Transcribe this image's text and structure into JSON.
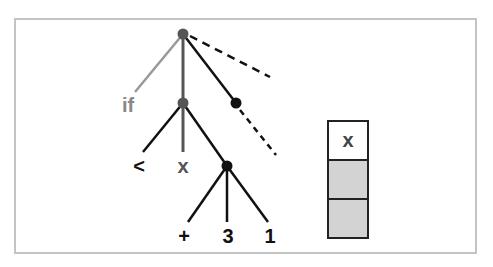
{
  "diagram": {
    "type": "tree",
    "colors": {
      "frame": "#c4c4c4",
      "edge": "#111111",
      "edge_gray": "#999999",
      "node_gray": "#555555",
      "node_black": "#111111",
      "label_black": "#111111",
      "label_gray": "#888888",
      "stack_fill": "#d3d3d3"
    },
    "nodes": [
      {
        "id": "root",
        "label": "",
        "style": "gray"
      },
      {
        "id": "cond",
        "label": "",
        "style": "gray"
      },
      {
        "id": "expr",
        "label": "",
        "style": "black"
      },
      {
        "id": "plus_node",
        "label": "",
        "style": "black"
      }
    ],
    "leaves": {
      "if": "if",
      "lt": "<",
      "x": "x",
      "plus": "+",
      "three": "3",
      "one": "1"
    },
    "stack": {
      "cells": [
        {
          "label": "x",
          "filled": false
        },
        {
          "label": "",
          "filled": true
        },
        {
          "label": "",
          "filled": true
        }
      ]
    }
  }
}
